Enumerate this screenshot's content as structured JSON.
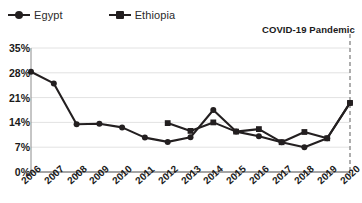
{
  "legend": {
    "position": "top-left",
    "entries": [
      {
        "label": "Egypt",
        "marker": "circle-marker-icon",
        "color": "#231f20"
      },
      {
        "label": "Ethiopia",
        "marker": "square-marker-icon",
        "color": "#231f20"
      }
    ]
  },
  "annotation": {
    "text": "COVID-19 Pandemic",
    "line_style": "dashed",
    "line_color": "#9a9a9a",
    "at_category": "2020"
  },
  "axis": {
    "y_ticks": [
      "0%",
      "7%",
      "14%",
      "21%",
      "28%",
      "35%"
    ],
    "x_ticks": [
      "2006",
      "2007",
      "2008",
      "2009",
      "2010",
      "2011",
      "2012",
      "2013",
      "2014",
      "2015",
      "2016",
      "2017",
      "2018",
      "2019",
      "2020"
    ]
  },
  "chart_data": {
    "type": "line",
    "title": "",
    "xlabel": "",
    "ylabel": "",
    "ylim": [
      0,
      35
    ],
    "ytick_values": [
      0,
      7,
      14,
      21,
      28,
      35
    ],
    "grid": true,
    "legend_position": "top-left",
    "categories": [
      "2006",
      "2007",
      "2008",
      "2009",
      "2010",
      "2011",
      "2012",
      "2013",
      "2014",
      "2015",
      "2016",
      "2017",
      "2018",
      "2019",
      "2020"
    ],
    "series": [
      {
        "name": "Egypt",
        "marker": "circle",
        "color": "#231f20",
        "values": [
          28.3,
          25.0,
          13.5,
          13.6,
          12.6,
          9.7,
          8.5,
          9.8,
          17.5,
          11.4,
          10.1,
          8.4,
          7.0,
          9.5,
          19.5
        ]
      },
      {
        "name": "Ethiopia",
        "marker": "square",
        "color": "#231f20",
        "values": [
          null,
          null,
          null,
          null,
          null,
          null,
          13.8,
          11.6,
          14.0,
          11.4,
          12.1,
          8.4,
          11.3,
          9.5,
          19.5
        ]
      }
    ],
    "annotations": [
      {
        "text": "COVID-19 Pandemic",
        "x": "2020",
        "type": "vertical-dashed-line"
      }
    ]
  }
}
